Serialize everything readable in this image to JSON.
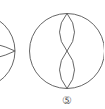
{
  "diagram": {
    "figures": [
      {
        "id": "figure-4-partial",
        "description": "circle with horizontal lens shape (partially visible)"
      },
      {
        "id": "figure-5",
        "description": "circle with two stacked vertical lens shapes",
        "label": "⑤"
      }
    ],
    "stroke_color": "#555555",
    "background": "#ffffff"
  }
}
